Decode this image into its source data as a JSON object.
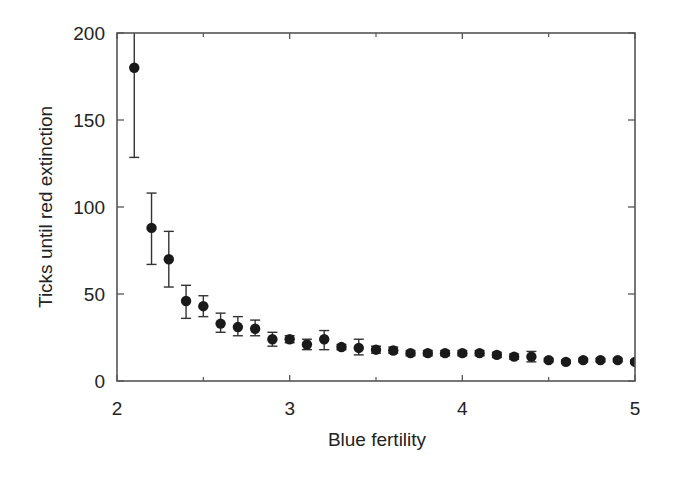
{
  "chart_data": {
    "type": "scatter",
    "title": "",
    "xlabel": "Blue fertility",
    "ylabel": "Ticks until red extinction",
    "xlim": [
      2,
      5
    ],
    "ylim": [
      0,
      200
    ],
    "xticks": [
      2,
      3,
      4,
      5
    ],
    "yticks": [
      0,
      50,
      100,
      150,
      200
    ],
    "grid": false,
    "legend": null,
    "marker": "filled-circle",
    "error_bars": true,
    "series": [
      {
        "name": "Ticks until red extinction",
        "x": [
          2.1,
          2.2,
          2.3,
          2.4,
          2.5,
          2.6,
          2.7,
          2.8,
          2.9,
          3.0,
          3.1,
          3.2,
          3.3,
          3.4,
          3.5,
          3.6,
          3.7,
          3.8,
          3.9,
          4.0,
          4.1,
          4.2,
          4.3,
          4.4,
          4.5,
          4.6,
          4.7,
          4.8,
          4.9,
          5.0
        ],
        "y": [
          180,
          88,
          70,
          46,
          43,
          33,
          31,
          30,
          24,
          24,
          21,
          24,
          19.5,
          19,
          18,
          17.5,
          16,
          16,
          16,
          16,
          16,
          15,
          14,
          14,
          12,
          11,
          12,
          12,
          12,
          11
        ],
        "err_low": [
          128.5,
          67,
          54,
          36,
          37,
          28,
          26,
          26,
          20,
          22,
          18,
          18,
          18,
          15,
          16,
          16,
          14.5,
          14.5,
          14.5,
          14.5,
          14.5,
          13.5,
          12.5,
          11,
          11,
          10,
          11,
          11,
          11,
          10
        ],
        "err_high": [
          232,
          108,
          86,
          55,
          49,
          39,
          37,
          35,
          28,
          26,
          24,
          29,
          21,
          24,
          20,
          19.5,
          17.5,
          17.5,
          17.5,
          17.5,
          17.5,
          16.5,
          15.5,
          17,
          13,
          12,
          13,
          13,
          13,
          12
        ]
      }
    ]
  },
  "labels": {
    "xlabel": "Blue fertility",
    "ylabel": "Ticks until red extinction",
    "xticks": [
      "2",
      "3",
      "4",
      "5"
    ],
    "yticks": [
      "0",
      "50",
      "100",
      "150",
      "200"
    ]
  },
  "style": {
    "axis_color": "#555555",
    "marker_color": "#1a1a1a",
    "errorbar_color": "#333333",
    "text_color": "#222222"
  }
}
